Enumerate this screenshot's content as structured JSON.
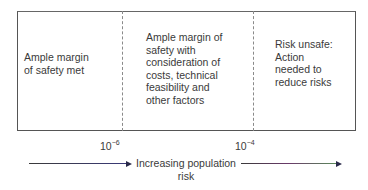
{
  "regions": [
    {
      "label": "Ample margin of safety met"
    },
    {
      "label": "Ample margin of safety with consideration of costs, technical feasibility and other factors"
    },
    {
      "label": "Risk unsafe: Action needed to reduce risks"
    }
  ],
  "region_lines": {
    "r1": [
      "Ample margin",
      "of safety met"
    ],
    "r2": [
      "Ample margin of",
      "safety with",
      "consideration of",
      "costs, technical",
      "feasibility and",
      "other factors"
    ],
    "r3": [
      "Risk unsafe:",
      "Action",
      "needed to",
      "reduce risks"
    ]
  },
  "thresholds": [
    {
      "base": "10",
      "exponent": "−6"
    },
    {
      "base": "10",
      "exponent": "−4"
    }
  ],
  "axis": {
    "label_line1": "Increasing population",
    "label_line2": "risk"
  },
  "colors": {
    "border": "#555555",
    "dash": "#8a8a8a",
    "arrow": "#2a2a4a"
  }
}
